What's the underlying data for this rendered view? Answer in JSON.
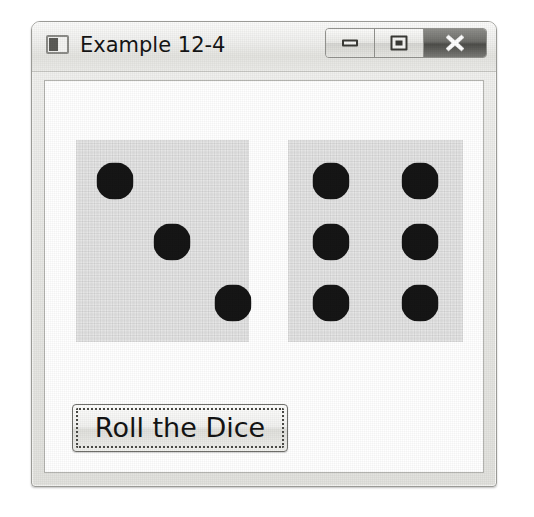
{
  "window": {
    "title": "Example 12-4",
    "icon": "window-app-icon",
    "controls": [
      {
        "name": "minimize",
        "label": "Minimize",
        "glyph": "minimize-icon"
      },
      {
        "name": "maximize",
        "label": "Maximize",
        "glyph": "maximize-icon"
      },
      {
        "name": "close",
        "label": "Close",
        "glyph": "close-x-icon"
      }
    ]
  },
  "colors": {
    "page_background": "#ffffff",
    "window_frame": "#e9e9e6",
    "window_border": "#9a9a96",
    "titlebar_top": "#fbfbfa",
    "client_background": "#ffffff",
    "die_face": "#e6e6e6",
    "pip": "#161616",
    "close_button": "#6e6e6a",
    "button_face": "#f2f2f0",
    "focus_ring": "#4a4a46",
    "text": "#141414"
  },
  "dice": [
    {
      "name": "die-left",
      "value": 3,
      "face_label": "3",
      "pips": [
        {
          "x": 39,
          "y": 41
        },
        {
          "x": 96,
          "y": 102
        },
        {
          "x": 157,
          "y": 163
        }
      ]
    },
    {
      "name": "die-right",
      "value": 6,
      "face_label": "6",
      "pips": [
        {
          "x": 43,
          "y": 41
        },
        {
          "x": 43,
          "y": 102
        },
        {
          "x": 43,
          "y": 163
        },
        {
          "x": 132,
          "y": 41
        },
        {
          "x": 132,
          "y": 102
        },
        {
          "x": 132,
          "y": 163
        }
      ]
    }
  ],
  "button": {
    "label": "Roll the Dice",
    "focused": true
  }
}
